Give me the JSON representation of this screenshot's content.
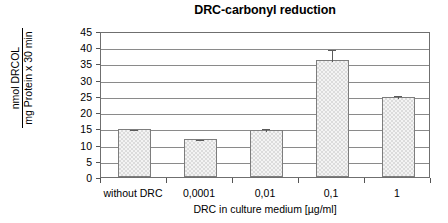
{
  "chart_data": {
    "type": "bar",
    "title": "DRC-carbonyl reduction",
    "xlabel": "DRC in culture medium [µg/ml]",
    "ylabel_numerator": "nmol DRCOL",
    "ylabel_denominator": "mg Protein x 30 min",
    "categories": [
      "without DRC",
      "0,0001",
      "0,01",
      "0,1",
      "1"
    ],
    "values": [
      14.9,
      11.6,
      14.6,
      36.2,
      24.7
    ],
    "errors": [
      0.3,
      0.4,
      0.9,
      3.6,
      1.0
    ],
    "ylim": [
      0,
      45
    ],
    "yticks": [
      0,
      5,
      10,
      15,
      20,
      25,
      30,
      35,
      40,
      45
    ],
    "ytick_labels": [
      "0",
      "5",
      "10",
      "15",
      "20",
      "25",
      "30",
      "35",
      "40",
      "45"
    ],
    "grid": true,
    "legend": false,
    "series": [
      {
        "name": "DRC-carbonyl reduction",
        "values": [
          14.9,
          11.6,
          14.6,
          36.2,
          24.7
        ]
      }
    ]
  }
}
